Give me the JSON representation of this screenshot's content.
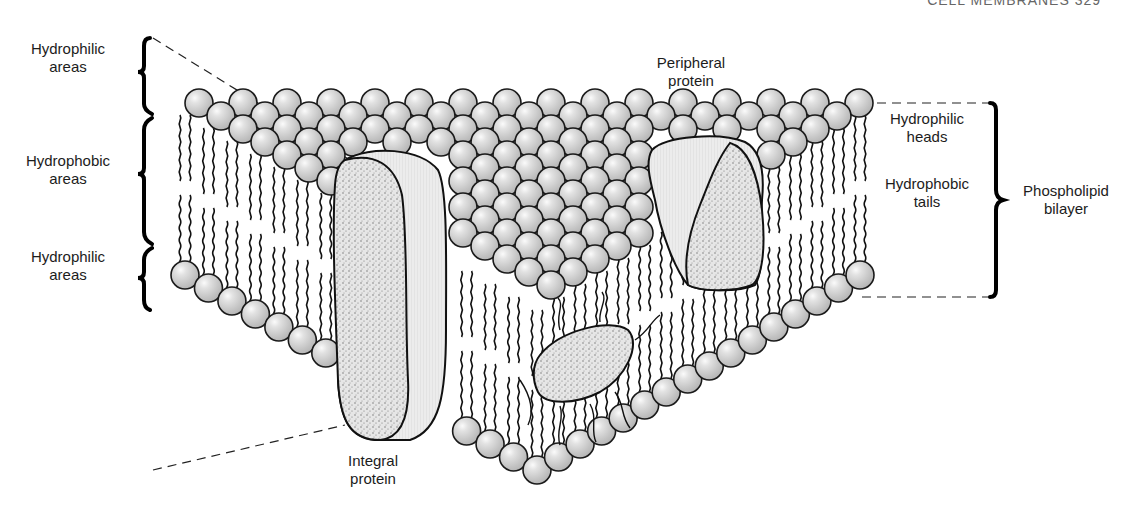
{
  "figure": {
    "header_fragment": "CELL MEMBRANES 329"
  },
  "labels": {
    "left_top": {
      "line1": "Hydrophilic",
      "line2": "areas"
    },
    "left_middle": {
      "line1": "Hydrophobic",
      "line2": "areas"
    },
    "left_bottom": {
      "line1": "Hydrophilic",
      "line2": "areas"
    },
    "peripheral": {
      "line1": "Peripheral",
      "line2": "protein"
    },
    "integral": {
      "line1": "Integral",
      "line2": "protein"
    },
    "right_heads": {
      "line1": "Hydrophilic",
      "line2": "heads"
    },
    "right_tails": {
      "line1": "Hydrophobic",
      "line2": "tails"
    },
    "bilayer": {
      "line1": "Phospholipid",
      "line2": "bilayer"
    }
  },
  "colors": {
    "ball_fill": "#c9c9c9",
    "ball_highlight": "#f4f4f4",
    "outline": "#1a1a1a",
    "protein_stipple": "#d8d8d8",
    "protein_side": "#e3e3e3",
    "background": "#ffffff"
  },
  "geometry": {
    "top_left": [
      185,
      103
    ],
    "top_right": [
      860,
      103
    ],
    "top_apex": [
      540,
      300
    ],
    "bottom_left": [
      185,
      275
    ],
    "bottom_right": [
      860,
      275
    ],
    "bottom_apex": [
      537,
      470
    ],
    "ball_radius": 14
  }
}
